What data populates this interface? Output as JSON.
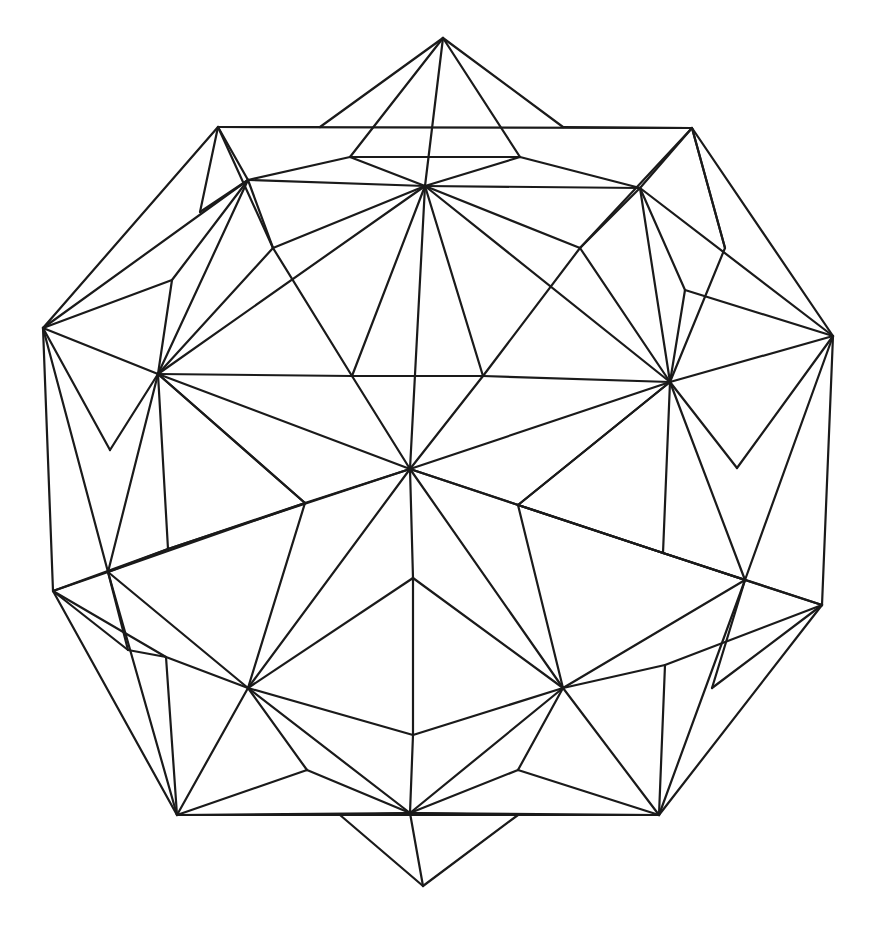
{
  "figure": {
    "stroke_color": "#1a1a1a",
    "background": "#ffffff",
    "width": 882,
    "height": 939
  },
  "points": {
    "T": [
      443,
      38
    ],
    "TL": [
      218,
      127
    ],
    "TR": [
      692,
      128
    ],
    "L": [
      43,
      328
    ],
    "R": [
      833,
      336
    ],
    "LL": [
      53,
      591
    ],
    "RL": [
      822,
      605
    ],
    "B": [
      423,
      886
    ],
    "BL": [
      177,
      815
    ],
    "BR": [
      659,
      815
    ],
    "C": [
      410,
      469
    ],
    "h1": [
      425,
      186
    ],
    "h2": [
      640,
      188
    ],
    "h3": [
      580,
      248
    ],
    "h4": [
      273,
      248
    ],
    "h5": [
      248,
      180
    ],
    "h6": [
      158,
      374
    ],
    "h7": [
      352,
      376
    ],
    "h8": [
      483,
      376
    ],
    "h9": [
      670,
      382
    ],
    "h10": [
      305,
      503
    ],
    "h11": [
      518,
      505
    ],
    "h12": [
      168,
      549
    ],
    "h13": [
      663,
      553
    ],
    "h14": [
      108,
      572
    ],
    "h15": [
      745,
      580
    ],
    "h16": [
      248,
      688
    ],
    "h17": [
      563,
      688
    ],
    "h18": [
      413,
      578
    ],
    "h19": [
      413,
      735
    ],
    "h20": [
      410,
      813
    ],
    "h21": [
      166,
      657
    ],
    "h22": [
      665,
      665
    ],
    "e1": [
      350,
      157
    ],
    "e2": [
      520,
      157
    ],
    "e3": [
      172,
      280
    ],
    "e4": [
      110,
      450
    ],
    "e5": [
      685,
      290
    ],
    "e6": [
      737,
      468
    ],
    "e7": [
      307,
      770
    ],
    "e8": [
      518,
      770
    ],
    "e9": [
      175,
      255
    ],
    "e10": [
      725,
      248
    ],
    "e11": [
      128,
      650
    ],
    "e12": [
      712,
      688
    ],
    "e13": [
      340,
      815
    ],
    "e14": [
      518,
      815
    ],
    "e15": [
      210,
      127
    ],
    "e16": [
      563,
      127
    ],
    "e17": [
      320,
      127
    ],
    "e18": [
      200,
      212
    ]
  },
  "edges": [
    [
      "T",
      "e1"
    ],
    [
      "T",
      "e2"
    ],
    [
      "T",
      "h1"
    ],
    [
      "T",
      "e17"
    ],
    [
      "T",
      "e16"
    ],
    [
      "e1",
      "e2"
    ],
    [
      "e1",
      "h1"
    ],
    [
      "e2",
      "h1"
    ],
    [
      "TL",
      "e17"
    ],
    [
      "TL",
      "h5"
    ],
    [
      "TL",
      "e18"
    ],
    [
      "TL",
      "h4"
    ],
    [
      "TR",
      "e16"
    ],
    [
      "TR",
      "h2"
    ],
    [
      "TR",
      "e10"
    ],
    [
      "TR",
      "h3"
    ],
    [
      "h5",
      "h1"
    ],
    [
      "h5",
      "e1"
    ],
    [
      "h5",
      "L"
    ],
    [
      "h5",
      "h6"
    ],
    [
      "h5",
      "h4"
    ],
    [
      "h5",
      "e3"
    ],
    [
      "h2",
      "h1"
    ],
    [
      "h2",
      "e2"
    ],
    [
      "h2",
      "R"
    ],
    [
      "h2",
      "h9"
    ],
    [
      "h2",
      "h3"
    ],
    [
      "h2",
      "e5"
    ],
    [
      "h1",
      "h4"
    ],
    [
      "h1",
      "h3"
    ],
    [
      "h1",
      "h7"
    ],
    [
      "h1",
      "h8"
    ],
    [
      "h1",
      "C"
    ],
    [
      "h1",
      "h6"
    ],
    [
      "h1",
      "h9"
    ],
    [
      "L",
      "e3"
    ],
    [
      "L",
      "h6"
    ],
    [
      "L",
      "e4"
    ],
    [
      "L",
      "h14"
    ],
    [
      "e3",
      "h6"
    ],
    [
      "e4",
      "h6"
    ],
    [
      "R",
      "e5"
    ],
    [
      "R",
      "h9"
    ],
    [
      "R",
      "e6"
    ],
    [
      "R",
      "h15"
    ],
    [
      "e5",
      "h9"
    ],
    [
      "e6",
      "h9"
    ],
    [
      "h6",
      "h7"
    ],
    [
      "h6",
      "C"
    ],
    [
      "h6",
      "h4"
    ],
    [
      "h6",
      "h10"
    ],
    [
      "h6",
      "h12"
    ],
    [
      "h6",
      "h14"
    ],
    [
      "h9",
      "h8"
    ],
    [
      "h9",
      "C"
    ],
    [
      "h9",
      "h3"
    ],
    [
      "h9",
      "h11"
    ],
    [
      "h9",
      "h13"
    ],
    [
      "h9",
      "h15"
    ],
    [
      "h4",
      "h7"
    ],
    [
      "h3",
      "h8"
    ],
    [
      "h7",
      "C"
    ],
    [
      "h8",
      "C"
    ],
    [
      "h7",
      "h8"
    ],
    [
      "C",
      "h10"
    ],
    [
      "C",
      "h11"
    ],
    [
      "C",
      "h18"
    ],
    [
      "C",
      "h16"
    ],
    [
      "C",
      "h17"
    ],
    [
      "C",
      "h12"
    ],
    [
      "C",
      "h13"
    ],
    [
      "h10",
      "h12"
    ],
    [
      "h10",
      "h16"
    ],
    [
      "h10",
      "h14"
    ],
    [
      "h10",
      "h6"
    ],
    [
      "h11",
      "h13"
    ],
    [
      "h11",
      "h17"
    ],
    [
      "h11",
      "h15"
    ],
    [
      "h11",
      "h9"
    ],
    [
      "LL",
      "h14"
    ],
    [
      "LL",
      "e11"
    ],
    [
      "LL",
      "h12"
    ],
    [
      "LL",
      "h21"
    ],
    [
      "RL",
      "h15"
    ],
    [
      "RL",
      "e12"
    ],
    [
      "RL",
      "h13"
    ],
    [
      "RL",
      "h22"
    ],
    [
      "h14",
      "h12"
    ],
    [
      "h14",
      "h16"
    ],
    [
      "h14",
      "BL"
    ],
    [
      "h14",
      "e11"
    ],
    [
      "h15",
      "h13"
    ],
    [
      "h15",
      "h17"
    ],
    [
      "h15",
      "BR"
    ],
    [
      "h15",
      "e12"
    ],
    [
      "h16",
      "h18"
    ],
    [
      "h16",
      "h19"
    ],
    [
      "h16",
      "h20"
    ],
    [
      "h16",
      "BL"
    ],
    [
      "h16",
      "e7"
    ],
    [
      "h16",
      "h21"
    ],
    [
      "h17",
      "h18"
    ],
    [
      "h17",
      "h19"
    ],
    [
      "h17",
      "h20"
    ],
    [
      "h17",
      "BR"
    ],
    [
      "h17",
      "e8"
    ],
    [
      "h17",
      "h22"
    ],
    [
      "h18",
      "h19"
    ],
    [
      "h19",
      "h20"
    ],
    [
      "BL",
      "h21"
    ],
    [
      "BL",
      "e7"
    ],
    [
      "BL",
      "h20"
    ],
    [
      "BL",
      "BR"
    ],
    [
      "BR",
      "h22"
    ],
    [
      "BR",
      "e8"
    ],
    [
      "BR",
      "h20"
    ],
    [
      "h20",
      "e7"
    ],
    [
      "h20",
      "e8"
    ],
    [
      "h20",
      "e13"
    ],
    [
      "h20",
      "e14"
    ],
    [
      "h20",
      "B"
    ],
    [
      "B",
      "e13"
    ],
    [
      "B",
      "e14"
    ],
    [
      "TL",
      "TR"
    ],
    [
      "TL",
      "L"
    ],
    [
      "L",
      "LL"
    ],
    [
      "LL",
      "BL"
    ],
    [
      "TR",
      "R"
    ],
    [
      "R",
      "RL"
    ],
    [
      "RL",
      "BR"
    ],
    [
      "h5",
      "e18"
    ],
    [
      "TR",
      "e10"
    ],
    [
      "e10",
      "h9"
    ],
    [
      "h21",
      "e11"
    ]
  ]
}
